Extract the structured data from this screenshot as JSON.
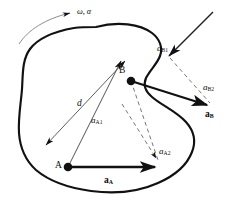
{
  "figure": {
    "name": "rigid-body-acceleration-diagram",
    "type": "engineering-mechanics-vector-diagram",
    "background_color": "#ffffff",
    "ink_color": "#111111",
    "width": 243,
    "height": 209
  },
  "labels": {
    "angular_motion": {
      "symbol": "ω",
      "secondary": "α",
      "text": "ω, α"
    },
    "point_a": "A",
    "point_b": "B",
    "distance": "d",
    "a_b1": {
      "base": "a",
      "sub": "B1"
    },
    "a_b2": {
      "base": "a",
      "sub": "B2"
    },
    "a_b": {
      "base": "a",
      "sub": "B"
    },
    "a_a1": {
      "base": "a",
      "sub": "A1"
    },
    "a_a2": {
      "base": "a",
      "sub": "A2"
    },
    "a_a": {
      "base": "a",
      "sub": "A"
    }
  },
  "geometry": {
    "body_outline_note": "irregular closed blob representing a rigid body",
    "point_a_coords": [
      68,
      167
    ],
    "point_b_coords": [
      131,
      80
    ],
    "vectors": [
      {
        "name": "a_A",
        "style": "solid-bold",
        "from": [
          68,
          167
        ],
        "to": [
          160,
          167
        ]
      },
      {
        "name": "a_A1",
        "style": "solid-thin",
        "from": [
          68,
          167
        ],
        "to": [
          122,
          62
        ]
      },
      {
        "name": "a_A2",
        "style": "dashed-thin",
        "from": [
          131,
          80
        ],
        "to": [
          157,
          159
        ]
      },
      {
        "name": "d",
        "style": "double-headed-thin",
        "from": [
          125,
          62
        ],
        "to": [
          45,
          146
        ]
      },
      {
        "name": "a_B1",
        "style": "solid-thin",
        "from": [
          212,
          13
        ],
        "to": [
          167,
          57
        ]
      },
      {
        "name": "a_B2",
        "style": "dashed-thin",
        "from": [
          167,
          57
        ],
        "to": [
          213,
          106
        ]
      },
      {
        "name": "a_B",
        "style": "solid-bold",
        "from": [
          131,
          80
        ],
        "to": [
          214,
          107
        ]
      },
      {
        "name": "omega_alpha_arc",
        "style": "curved-thin-arrow",
        "from": [
          22,
          40
        ],
        "to": [
          72,
          13
        ]
      }
    ]
  }
}
